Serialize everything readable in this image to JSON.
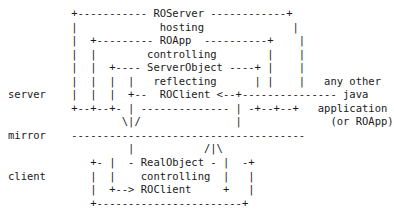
{
  "diagram": {
    "kind": "ascii-art-architecture-diagram",
    "background_color": "#ffffff",
    "text_color": "#1a1a1a",
    "labels": {
      "server": "server",
      "mirror": "mirror",
      "client": "client"
    },
    "nodes": {
      "ro_server": "ROServer",
      "hosting": "hosting",
      "ro_app": "ROApp",
      "controlling_top": "controlling",
      "server_object": "ServerObject",
      "reflecting": "reflecting",
      "ro_client_top": "ROClient",
      "real_object": "RealObject",
      "controlling_bottom": "controlling",
      "ro_client_bottom": "ROClient"
    },
    "side_note": {
      "line1": "any other",
      "line2": "java",
      "line3": "application",
      "line4": "(or ROApp)"
    },
    "art": "          +----------- ROServer ------------+\n          |             hosting              |\n          |  +--------- ROApp  ----------+    |\n          |  |        controlling        |    |\n          |  |  +---- ServerObject ----+ |    |\n          |  |  |  |   reflecting      | |    |   any other\nserver    |  |  |  +--  ROClient <--+--------------- java\n          +--+--+- | -------------- | -+--+--+   application\n                  \\|/               |              (or ROApp)\nmirror    -------------------------------------\n                   |           /|\\\n             +- |  - RealObject - |  -+\nclient       |  |    controlling  |   |\n             |  +--> ROClient     +   |\n             +-----------------------+\n"
  }
}
